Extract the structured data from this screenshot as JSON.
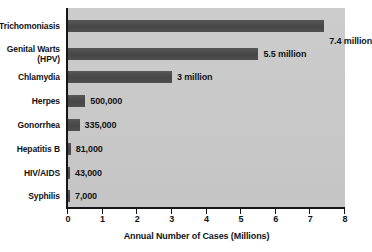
{
  "chart_data": {
    "type": "bar",
    "orientation": "horizontal",
    "title": "",
    "xlabel": "Annual Number of Cases (Millions)",
    "ylabel": "",
    "xlim": [
      0,
      8
    ],
    "xticks": [
      "0",
      "1",
      "2",
      "3",
      "4",
      "5",
      "6",
      "7",
      "8"
    ],
    "grid": false,
    "legend": null,
    "categories": [
      "Trichomoniasis",
      "Genital Warts\n(HPV)",
      "Chlamydia",
      "Herpes",
      "Gonorrhea",
      "Hepatitis B",
      "HIV/AIDS",
      "Syphilis"
    ],
    "values": [
      7.4,
      5.5,
      3.0,
      0.5,
      0.335,
      0.081,
      0.043,
      0.007
    ],
    "data_labels": [
      "7.4 million",
      "5.5 million",
      "3 million",
      "500,000",
      "335,000",
      "81,000",
      "43,000",
      "7,000"
    ],
    "units": "millions of cases per year",
    "colors": {
      "bar": "#4c4c4c",
      "plot_background": "#c9c9c9",
      "page_background": "#ffffff",
      "axis": "#15161a",
      "text": "#111318"
    }
  }
}
